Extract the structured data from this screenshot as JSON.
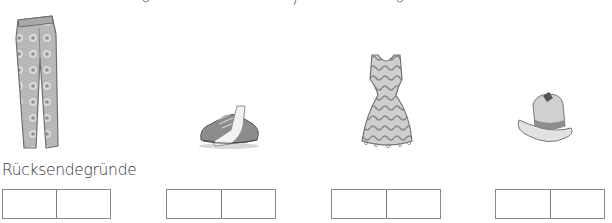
{
  "section": {
    "label": "Rücksendegründe"
  },
  "items": [
    {
      "name": "trousers",
      "icon": "trousers-illustration"
    },
    {
      "name": "sneakers",
      "icon": "sneaker-illustration"
    },
    {
      "name": "dress",
      "icon": "dress-illustration"
    },
    {
      "name": "hat",
      "icon": "hat-illustration"
    }
  ],
  "answer_boxes": [
    {
      "cells": [
        "",
        ""
      ]
    },
    {
      "cells": [
        "",
        ""
      ]
    },
    {
      "cells": [
        "",
        ""
      ]
    },
    {
      "cells": [
        "",
        ""
      ]
    }
  ],
  "colors": {
    "box_border": "#8a8a8a",
    "text": "#333333",
    "sketch_gray": "#9a9a9a"
  }
}
